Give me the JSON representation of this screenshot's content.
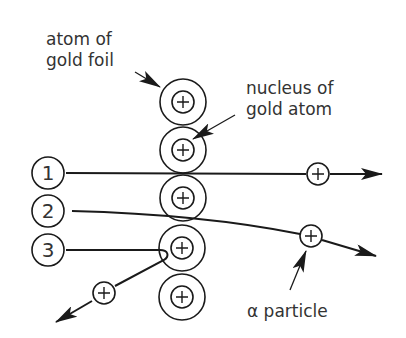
{
  "labels": {
    "atom_line1": "atom of",
    "atom_line2": "gold foil",
    "nucleus_line1": "nucleus of",
    "nucleus_line2": "gold atom",
    "alpha": "α particle"
  },
  "paths": [
    {
      "number": "1",
      "description": "passes straight through"
    },
    {
      "number": "2",
      "description": "slightly deflected"
    },
    {
      "number": "3",
      "description": "bounced back"
    }
  ],
  "nucleus_symbol": "+",
  "colors": {
    "line": "#1a1a1a",
    "text": "#333333",
    "background": "#ffffff"
  }
}
